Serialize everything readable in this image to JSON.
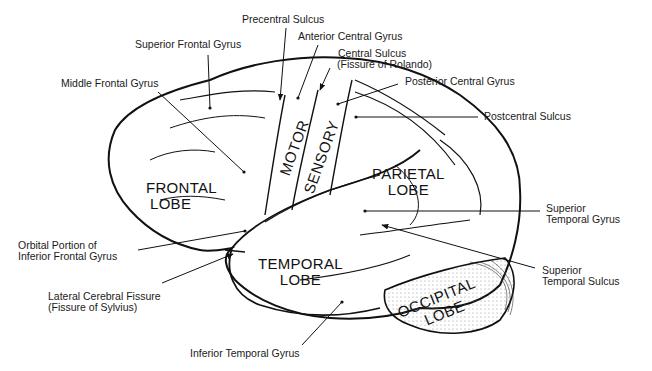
{
  "labels": {
    "precentral_sulcus": "Precentral Sulcus",
    "superior_frontal_gyrus": "Superior Frontal Gyrus",
    "anterior_central_gyrus": "Anterior Central Gyrus",
    "central_sulcus_1": "Central Sulcus",
    "central_sulcus_2": "(Fissure of Rolando)",
    "middle_frontal_gyrus": "Middle Frontal Gyrus",
    "posterior_central_gyrus": "Posterior Central Gyrus",
    "postcentral_sulcus": "Postcentral Sulcus",
    "superior_temporal_gyrus_1": "Superior",
    "superior_temporal_gyrus_2": "Temporal Gyrus",
    "orbital_portion_1": "Orbital Portion of",
    "orbital_portion_2": "Inferior Frontal Gyrus",
    "superior_temporal_sulcus_1": "Superior",
    "superior_temporal_sulcus_2": "Temporal Sulcus",
    "lateral_fissure_1": "Lateral Cerebral Fissure",
    "lateral_fissure_2": "(Fissure of Sylvius)",
    "inferior_temporal_gyrus": "Inferior Temporal Gyrus"
  },
  "regions": {
    "motor": "MOTOR",
    "sensory": "SENSORY",
    "frontal_1": "FRONTAL",
    "frontal_2": "LOBE",
    "parietal_1": "PARIETAL",
    "parietal_2": "LOBE",
    "temporal_1": "TEMPORAL",
    "temporal_2": "LOBE",
    "occipital_1": "OCCIPITAL",
    "occipital_2": "LOBE"
  }
}
